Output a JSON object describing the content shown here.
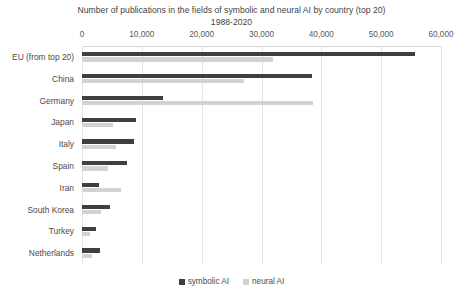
{
  "chart_data": {
    "type": "bar",
    "orientation": "horizontal",
    "title": "Number of publications in the fields of symbolic and neural AI by country (top 20)",
    "subtitle": "1988-2020",
    "xlabel": "",
    "ylabel": "",
    "xlim": [
      0,
      60000
    ],
    "xticks": [
      0,
      10000,
      20000,
      30000,
      40000,
      50000,
      60000
    ],
    "xtick_labels": [
      "0",
      "10,000",
      "20,000",
      "30,000",
      "40,000",
      "50,000",
      "60,000"
    ],
    "grid": true,
    "legend_position": "bottom",
    "categories": [
      "EU (from top 20)",
      "China",
      "Germany",
      "Japan",
      "Italy",
      "Spain",
      "Iran",
      "South Korea",
      "Turkey",
      "Netherlands"
    ],
    "series": [
      {
        "name": "symbolic AI",
        "color": "#3f3f3f",
        "values": [
          55600,
          38500,
          13600,
          9100,
          8700,
          7600,
          2900,
          4600,
          2400,
          3000
        ]
      },
      {
        "name": "neural AI",
        "color": "#d2d2d2",
        "values": [
          32000,
          27100,
          38600,
          5200,
          5700,
          4300,
          6500,
          3100,
          1300,
          1700
        ]
      }
    ],
    "legend_entries": [
      "symbolic AI",
      "neural AI"
    ]
  },
  "colors": {
    "symbolic": "#3f3f3f",
    "neural": "#d2d2d2",
    "grid": "#e2e2e2",
    "text": "#4a4a4a",
    "background": "#ffffff"
  }
}
